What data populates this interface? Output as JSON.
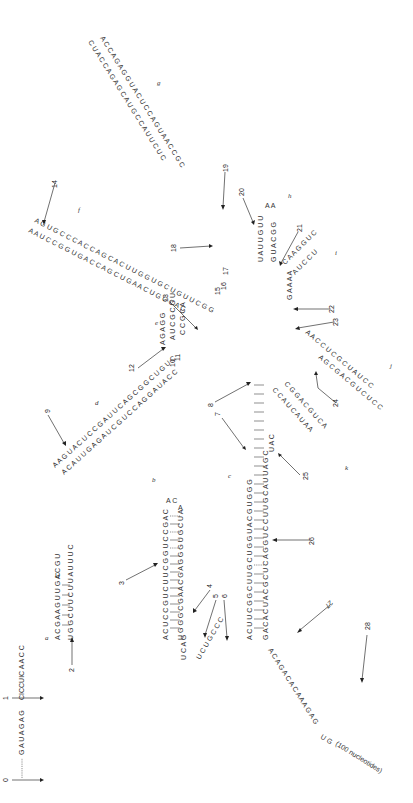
{
  "figure": {
    "type": "RNA secondary structure",
    "orientation": "rotated 90 degrees counter-clockwise",
    "annotation_tail": "(100 nucleotides)"
  },
  "domains": [
    "a",
    "b",
    "c",
    "d",
    "e",
    "f",
    "g",
    "h",
    "i",
    "j",
    "k"
  ],
  "markers": [
    "0",
    "1",
    "2",
    "3",
    "4",
    "5",
    "6",
    "7",
    "8",
    "9",
    "10",
    "11",
    "12",
    "13",
    "14",
    "15",
    "16",
    "17",
    "18",
    "19",
    "20",
    "21",
    "22",
    "23",
    "24",
    "25",
    "26",
    "27",
    "28"
  ],
  "sequences": {
    "five_prime_tail": "GAUAGAGCICCUICAACC",
    "stem_a_left": "GACUUGACAGUU",
    "stem_a_right": "UGGCUUCUUAUUUC",
    "stem_a_loop": "UU",
    "stem_b_left": "ACUCCGUCUUCGGUCCGAC",
    "stem_b_right": "AUGGGCGAACGAGGGUGCUA",
    "junction_4_6": "UCAGUCUGCCC",
    "stem_c_left": "UCCAAGCACUUCGGCUUGCUGGUACGUGG",
    "stem_c_right": "GACACUACGCUCAGGUCCUUGCAUUAGC",
    "stem_d": "AACGUACUCCGAUUCAGCGGCUGUC",
    "stem_d_pair": "ACAUUGAGAUCGUCCAGGAUACCUCA",
    "stem_e": "GAGGCUCGACUACC",
    "stem_e_pair": "AUCGGCAAUCAGC",
    "stem_f": "AAGUGCCCACCAGCACUUGGUGCUGUUCGG",
    "stem_f_pair": "AUCCGGUGACCAAGUGGAGCAAGACUUAGG",
    "stem_g": "CUACCAGAGCAUGCCAUUCUCCAGUAACCGCUGGC",
    "stem_h": "UUGUUAUUAAUCAGG",
    "stem_i": "CAAGGUCUCCUAAAAG",
    "stem_j": "AACCUCGCUAUCCUCGACCCCUC",
    "stem_k": "UCCGCGUAUGGACAUCUACAA",
    "three_prime_tail": "ACAGACACAAAGAGUGAU"
  }
}
